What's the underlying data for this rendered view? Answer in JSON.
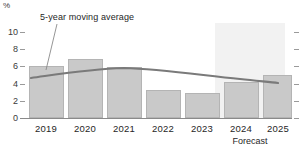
{
  "chart_data": {
    "type": "bar",
    "title": "",
    "xlabel": "",
    "ylabel": "%",
    "categories": [
      "2019",
      "2020",
      "2021",
      "2022",
      "2023",
      "2024",
      "2025"
    ],
    "values": [
      6.0,
      6.9,
      5.9,
      3.2,
      2.9,
      4.2,
      5.0
    ],
    "ylim": [
      0,
      10
    ],
    "yticks": [
      0,
      2,
      4,
      6,
      8,
      10
    ],
    "ytick_labels": [
      "0",
      "2",
      "4",
      "6",
      "8",
      "10"
    ],
    "grid": false,
    "legend": "none",
    "series": [
      {
        "name": "Annual value",
        "type": "bar",
        "values": [
          6.0,
          6.9,
          5.9,
          3.2,
          2.9,
          4.2,
          5.0
        ],
        "color": "#c9c9c9"
      },
      {
        "name": "5-year moving average",
        "type": "line",
        "values": [
          4.7,
          5.2,
          5.6,
          5.3,
          5.0,
          4.6,
          4.3
        ],
        "color": "#7a7a7a"
      }
    ],
    "annotations": [
      {
        "text": "5-year moving average",
        "target_category": "2019"
      },
      {
        "text": "Forecast",
        "target_categories": [
          "2024",
          "2025"
        ]
      }
    ],
    "forecast_region": {
      "label": "Forecast",
      "start_category": "2024",
      "end_category": "2025",
      "shade_color": "#f2f2f2"
    }
  },
  "axis": {
    "unit": "%",
    "tick_labels": [
      "10",
      "8",
      "6",
      "4",
      "2",
      "0"
    ]
  },
  "colors": {
    "bar_fill": "#c9c9c9",
    "bar_stroke": "#b4b4b4",
    "line": "#7a7a7a",
    "forecast_shade": "#f2f2f2",
    "axis": "#8a8a8a",
    "text": "#262626"
  }
}
